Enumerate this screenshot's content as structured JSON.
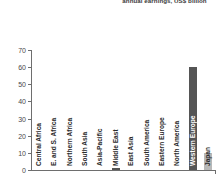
{
  "chart_title": "annual earnings, US$ billion",
  "axis": {
    "y_ticks": [
      "0",
      "10",
      "20",
      "30",
      "40",
      "50",
      "60",
      "70"
    ],
    "y_min": 0,
    "y_max": 70
  },
  "colors": {
    "bar_dark": "#555555",
    "bar_light": "#b8b8b8",
    "axis": "#6e6e6e",
    "text": "#2b2b2b",
    "title": "#3a3a3a"
  },
  "chart_data": {
    "type": "bar",
    "title": "annual earnings, US$ billion",
    "xlabel": "",
    "ylabel": "",
    "ylim": [
      0,
      70
    ],
    "grid": false,
    "legend": "none",
    "categories": [
      "Central Africa",
      "E. and S. Africa",
      "Northern Africa",
      "South Asia",
      "Asia-Pacific",
      "Middle East",
      "East Asia",
      "South America",
      "Eastern Europe",
      "North America",
      "Western Europe",
      "Japan"
    ],
    "values": [
      0,
      0,
      0,
      0,
      0,
      1,
      0,
      0,
      0,
      0,
      60,
      10
    ],
    "bar_colors": [
      "#555555",
      "#555555",
      "#555555",
      "#555555",
      "#555555",
      "#555555",
      "#555555",
      "#555555",
      "#555555",
      "#555555",
      "#555555",
      "#b8b8b8"
    ],
    "label_inside": [
      false,
      false,
      false,
      false,
      false,
      false,
      false,
      false,
      false,
      false,
      true,
      false
    ]
  }
}
